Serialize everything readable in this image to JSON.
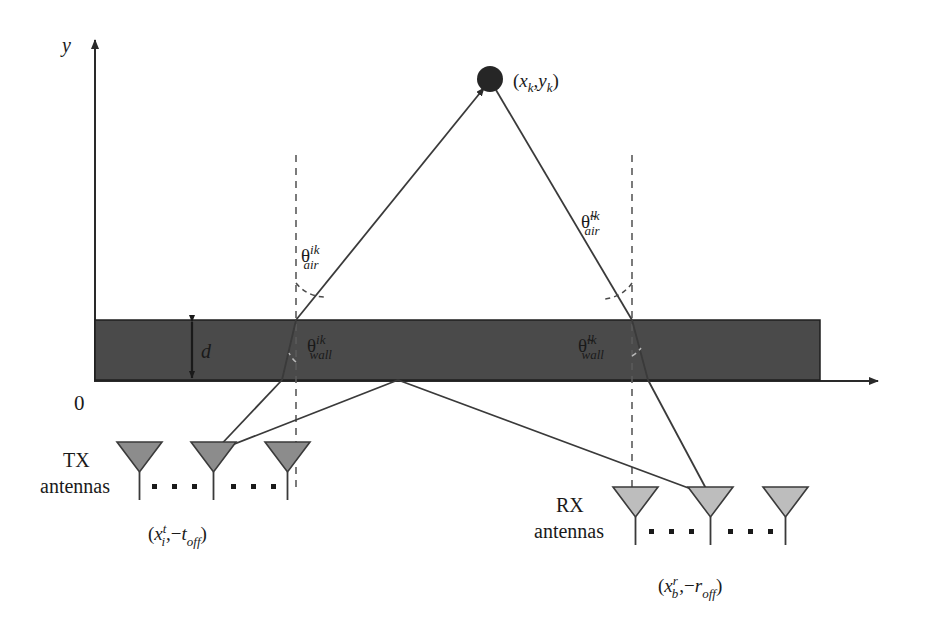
{
  "figure": {
    "type": "diagram",
    "axes": {
      "y_label": "y",
      "origin_label": "0"
    },
    "wall": {
      "thickness_label": "d",
      "color": "#4a4a4a"
    },
    "target": {
      "label": "(x",
      "label_sub1": "k",
      "label_mid": ",y",
      "label_sub2": "k",
      "label_end": ")",
      "full": "(x_k,y_k)",
      "color": "#262626"
    },
    "angles": {
      "air_left": {
        "symbol": "θ",
        "sup": "ik",
        "sub": "air"
      },
      "air_right": {
        "symbol": "θ̃",
        "sup": "lk",
        "sub": "air"
      },
      "wall_left": {
        "symbol": "θ",
        "sup": "ik",
        "sub": "wall"
      },
      "wall_right": {
        "symbol": "θ̃",
        "sup": "lk",
        "sub": "wall"
      }
    },
    "tx": {
      "line1": "TX",
      "line2": "antennas",
      "coord_open": "(x",
      "coord_sup": "t",
      "coord_sub": "i",
      "coord_mid": ",−t",
      "coord_sub2": "off",
      "coord_close": ")",
      "coord_full": "(x^t_i,−t_off)",
      "color": "#8c8c8c"
    },
    "rx": {
      "line1": "RX",
      "line2": "antennas",
      "coord_open": "(x",
      "coord_sup": "r",
      "coord_sub": "b",
      "coord_mid": ",−r",
      "coord_sub2": "off",
      "coord_close": ")",
      "coord_full": "(x^r_b,−r_off)",
      "color": "#bdbdbd"
    },
    "colors": {
      "line": "#3a3a3a",
      "wall": "#4a4a4a",
      "tx_fill": "#8c8c8c",
      "rx_fill": "#bdbdbd",
      "target_fill": "#262626",
      "background": "#ffffff"
    }
  }
}
